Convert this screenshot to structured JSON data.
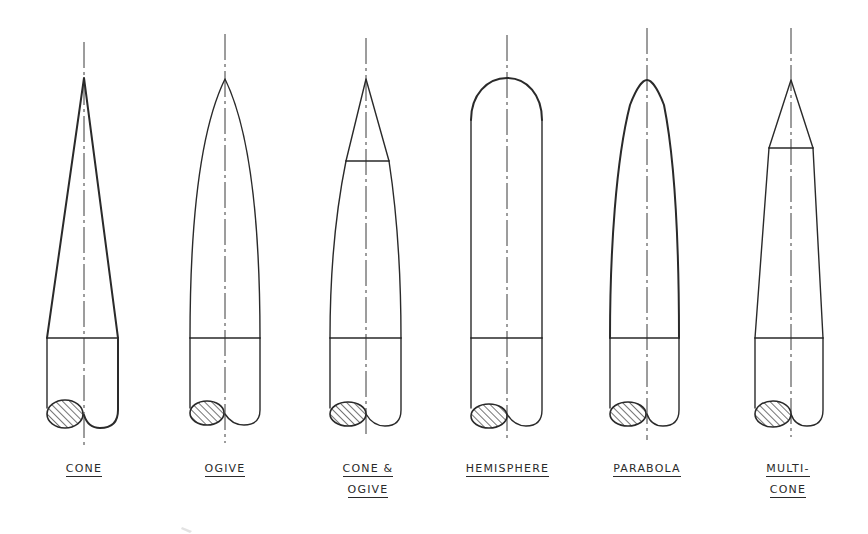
{
  "figure": {
    "shapes": [
      {
        "id": "cone",
        "label_lines": [
          "CONE"
        ]
      },
      {
        "id": "ogive",
        "label_lines": [
          "OGIVE"
        ]
      },
      {
        "id": "cone-ogive",
        "label_lines": [
          "CONE &",
          "OGIVE"
        ]
      },
      {
        "id": "hemisphere",
        "label_lines": [
          "HEMISPHERE"
        ]
      },
      {
        "id": "parabola",
        "label_lines": [
          "PARABOLA"
        ]
      },
      {
        "id": "multi-cone",
        "label_lines": [
          "MULTI-",
          "CONE"
        ]
      }
    ],
    "line_color": "#2a2a2a",
    "background": "#ffffff"
  }
}
